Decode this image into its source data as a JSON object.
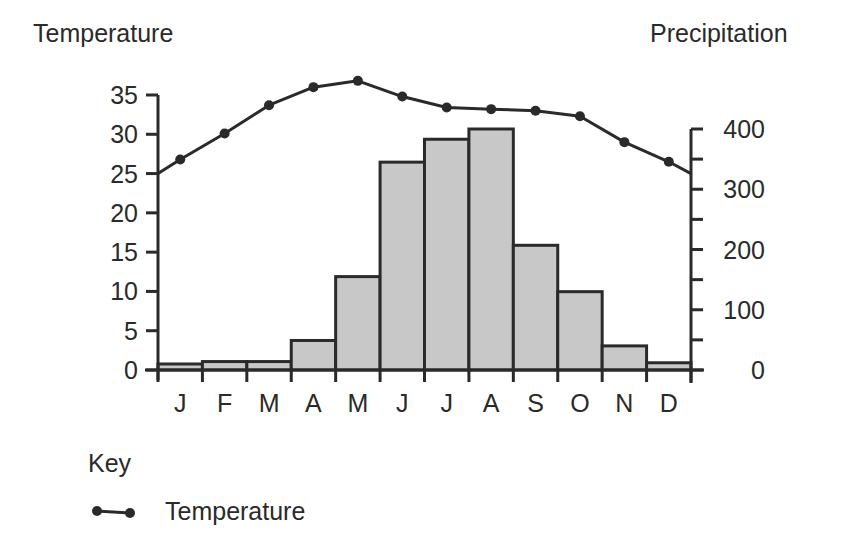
{
  "chart_data": {
    "type": "bar+line",
    "title": "",
    "categories": [
      "J",
      "F",
      "M",
      "A",
      "M",
      "J",
      "J",
      "A",
      "S",
      "O",
      "N",
      "D"
    ],
    "series": [
      {
        "name": "Precipitation",
        "type": "bar",
        "axis": "right",
        "values": [
          10,
          14,
          14,
          49,
          155,
          345,
          383,
          400,
          207,
          130,
          40,
          12
        ],
        "fill": "#c8c8c8",
        "stroke": "#2a2a2a"
      },
      {
        "name": "Temperature",
        "type": "line",
        "axis": "left",
        "values": [
          26.8,
          30.1,
          33.7,
          36.0,
          36.8,
          34.8,
          33.4,
          33.2,
          33.0,
          32.3,
          29.0,
          26.5
        ],
        "start_value": 25,
        "end_value": 25,
        "color": "#2a2a2a",
        "marker": "circle"
      }
    ],
    "left_axis": {
      "label": "Temperature",
      "ylim": [
        0,
        35
      ],
      "ticks": [
        0,
        5,
        10,
        15,
        20,
        25,
        30,
        35
      ]
    },
    "right_axis": {
      "label": "Precipitation",
      "ylim": [
        0,
        400
      ],
      "ticks": [
        0,
        100,
        200,
        300,
        400
      ],
      "minor_ticks": [
        50,
        150,
        250,
        350
      ]
    },
    "xlabel": "",
    "grid": false,
    "legend": {
      "title": "Key",
      "position": "bottom-left",
      "entries": [
        {
          "label": "Temperature",
          "symbol": "line-with-dots"
        }
      ]
    }
  },
  "labels": {
    "left_axis_title": "Temperature",
    "right_axis_title": "Precipitation",
    "key_title": "Key",
    "key_entry": "Temperature"
  }
}
